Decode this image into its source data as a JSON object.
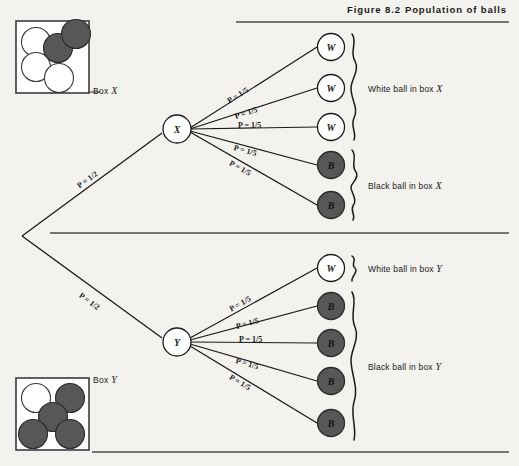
{
  "figure": {
    "number": "Figure 8.2",
    "title": "Population of balls"
  },
  "boxes": [
    {
      "id": "box-x",
      "label_prefix": "Box",
      "label_var": "X",
      "balls": [
        {
          "color": "white"
        },
        {
          "color": "white"
        },
        {
          "color": "white"
        },
        {
          "color": "black"
        },
        {
          "color": "black"
        }
      ]
    },
    {
      "id": "box-y",
      "label_prefix": "Box",
      "label_var": "Y",
      "balls": [
        {
          "color": "white"
        },
        {
          "color": "black"
        },
        {
          "color": "black"
        },
        {
          "color": "black"
        },
        {
          "color": "black"
        }
      ]
    }
  ],
  "nodes": {
    "root_label": "",
    "x_node": "X",
    "y_node": "Y"
  },
  "branch_probabilities": {
    "first_stage": "P = 1/2",
    "second_stage": "P = 1/5"
  },
  "upper_tree": {
    "node": "X",
    "first_prob": "P = 1/2",
    "leaves": [
      {
        "letter": "W",
        "color": "white",
        "prob": "P = 1/5"
      },
      {
        "letter": "W",
        "color": "white",
        "prob": "P = 1/5"
      },
      {
        "letter": "W",
        "color": "white",
        "prob": "P = 1/5"
      },
      {
        "letter": "B",
        "color": "black",
        "prob": "P = 1/5"
      },
      {
        "letter": "B",
        "color": "black",
        "prob": "P = 1/5"
      }
    ],
    "groups": [
      {
        "text_prefix": "White ball in box",
        "text_var": "X",
        "leaves": [
          0,
          1,
          2
        ]
      },
      {
        "text_prefix": "Black ball in box",
        "text_var": "X",
        "leaves": [
          3,
          4
        ]
      }
    ]
  },
  "lower_tree": {
    "node": "Y",
    "first_prob": "P = 1/2",
    "leaves": [
      {
        "letter": "W",
        "color": "white",
        "prob": "P = 1/5"
      },
      {
        "letter": "B",
        "color": "black",
        "prob": "P = 1/5"
      },
      {
        "letter": "B",
        "color": "black",
        "prob": "P = 1/5"
      },
      {
        "letter": "B",
        "color": "black",
        "prob": "P = 1/5"
      },
      {
        "letter": "B",
        "color": "black",
        "prob": "P = 1/5"
      }
    ],
    "groups": [
      {
        "text_prefix": "White ball in box",
        "text_var": "Y",
        "leaves": [
          0
        ]
      },
      {
        "text_prefix": "Black ball in box",
        "text_var": "Y",
        "leaves": [
          1,
          2,
          3,
          4
        ]
      }
    ]
  },
  "labels": {
    "white_box_x": "White ball in box",
    "black_box_x": "Black ball in box",
    "white_box_y": "White ball in box",
    "black_box_y": "Black ball in box",
    "var_x": "X",
    "var_y": "Y",
    "box_x": "Box",
    "box_y": "Box"
  },
  "colors": {
    "page_background": "#f4f2ee",
    "ink": "#1a1a1a",
    "ball_black": "#4a4a4a",
    "ball_white": "#ffffff",
    "rule": "#4a4a52"
  }
}
